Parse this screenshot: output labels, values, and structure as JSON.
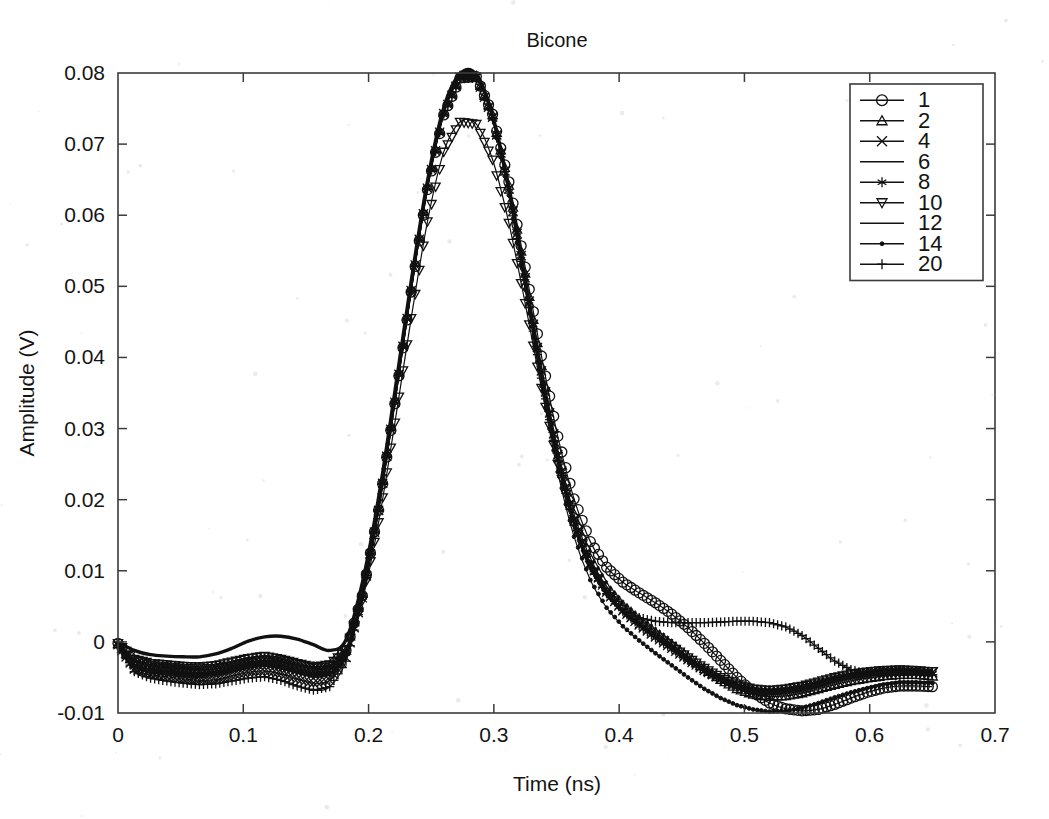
{
  "chart_data": {
    "type": "line",
    "title": "Bicone",
    "xlabel": "Time (ns)",
    "ylabel": "Amplitude (V)",
    "xlim": [
      0,
      0.7
    ],
    "ylim": [
      -0.01,
      0.08
    ],
    "xticks": [
      0,
      0.1,
      0.2,
      0.3,
      0.4,
      0.5,
      0.6,
      0.7
    ],
    "xticklabels": [
      "0",
      "0.1",
      "0.2",
      "0.3",
      "0.4",
      "0.5",
      "0.6",
      "0.7"
    ],
    "yticks": [
      -0.01,
      0,
      0.01,
      0.02,
      0.03,
      0.04,
      0.05,
      0.06,
      0.07,
      0.08
    ],
    "yticklabels": [
      "-0.01",
      "0",
      "0.01",
      "0.02",
      "0.03",
      "0.04",
      "0.05",
      "0.06",
      "0.07",
      "0.08"
    ],
    "grid": false,
    "legend_position": "top-right",
    "legend_entries": [
      "1",
      "2",
      "4",
      "6",
      "8",
      "10",
      "12",
      "14",
      "20"
    ],
    "x": [
      0,
      0.013,
      0.026,
      0.039,
      0.052,
      0.065,
      0.078,
      0.091,
      0.104,
      0.117,
      0.13,
      0.143,
      0.156,
      0.169,
      0.182,
      0.195,
      0.208,
      0.221,
      0.234,
      0.247,
      0.26,
      0.273,
      0.286,
      0.299,
      0.312,
      0.325,
      0.338,
      0.351,
      0.364,
      0.377,
      0.39,
      0.403,
      0.416,
      0.429,
      0.442,
      0.455,
      0.468,
      0.481,
      0.494,
      0.507,
      0.52,
      0.533,
      0.546,
      0.559,
      0.572,
      0.585,
      0.598,
      0.611,
      0.624,
      0.637,
      0.65
    ],
    "series": [
      {
        "name": "1",
        "marker": "circle",
        "linewidth": 1.2,
        "values": [
          -0.0002,
          -0.0028,
          -0.0034,
          -0.0036,
          -0.0038,
          -0.0039,
          -0.0038,
          -0.0034,
          -0.0029,
          -0.0026,
          -0.0028,
          -0.0033,
          -0.0038,
          -0.0036,
          -0.0012,
          0.0065,
          0.0185,
          0.0335,
          0.0492,
          0.0636,
          0.0741,
          0.0793,
          0.0795,
          0.0742,
          0.0647,
          0.0527,
          0.0402,
          0.0289,
          0.0201,
          0.0141,
          0.0105,
          0.0084,
          0.0069,
          0.0055,
          0.0039,
          0.002,
          -0.0002,
          -0.0026,
          -0.005,
          -0.0071,
          -0.0086,
          -0.0094,
          -0.0097,
          -0.0095,
          -0.0088,
          -0.0079,
          -0.0071,
          -0.0065,
          -0.0062,
          -0.0062,
          -0.0063
        ]
      },
      {
        "name": "2",
        "marker": "triangle-up",
        "linewidth": 1.2,
        "values": [
          -0.0003,
          -0.0031,
          -0.0038,
          -0.004,
          -0.0042,
          -0.0043,
          -0.0041,
          -0.0036,
          -0.0031,
          -0.0028,
          -0.0031,
          -0.0036,
          -0.0041,
          -0.0038,
          -0.0012,
          0.0068,
          0.0189,
          0.034,
          0.0497,
          0.0641,
          0.0745,
          0.0796,
          0.0796,
          0.0741,
          0.0642,
          0.0518,
          0.0388,
          0.0271,
          0.018,
          0.0118,
          0.0078,
          0.0052,
          0.0032,
          0.0014,
          -0.0003,
          -0.0021,
          -0.0038,
          -0.0053,
          -0.0066,
          -0.0074,
          -0.0077,
          -0.0076,
          -0.0072,
          -0.0066,
          -0.006,
          -0.0055,
          -0.0051,
          -0.0048,
          -0.0046,
          -0.0046,
          -0.0048
        ]
      },
      {
        "name": "4",
        "marker": "x-cross",
        "linewidth": 1.2,
        "values": [
          -0.0004,
          -0.0038,
          -0.0046,
          -0.0049,
          -0.0052,
          -0.0054,
          -0.0053,
          -0.0048,
          -0.0043,
          -0.0041,
          -0.0045,
          -0.0052,
          -0.0058,
          -0.0054,
          -0.0022,
          0.0062,
          0.0185,
          0.0337,
          0.0494,
          0.0638,
          0.0743,
          0.0794,
          0.0794,
          0.0738,
          0.0637,
          0.0512,
          0.0381,
          0.0263,
          0.0172,
          0.011,
          0.007,
          0.0044,
          0.0024,
          0.0007,
          -0.0009,
          -0.0025,
          -0.004,
          -0.0052,
          -0.0062,
          -0.0068,
          -0.007,
          -0.0068,
          -0.0064,
          -0.0058,
          -0.0052,
          -0.0047,
          -0.0043,
          -0.0041,
          -0.004,
          -0.0041,
          -0.0043
        ]
      },
      {
        "name": "6",
        "marker": "none",
        "linewidth": 1.2,
        "values": [
          -0.0002,
          -0.0026,
          -0.0032,
          -0.0034,
          -0.0036,
          -0.0037,
          -0.0035,
          -0.003,
          -0.0025,
          -0.0022,
          -0.0026,
          -0.0032,
          -0.0037,
          -0.0034,
          -0.0009,
          0.0071,
          0.0192,
          0.0343,
          0.05,
          0.0643,
          0.0747,
          0.0797,
          0.0797,
          0.074,
          0.0639,
          0.0513,
          0.0382,
          0.0264,
          0.0173,
          0.0111,
          0.0071,
          0.0045,
          0.0026,
          0.0009,
          -0.0007,
          -0.0023,
          -0.0038,
          -0.0051,
          -0.0061,
          -0.0067,
          -0.0069,
          -0.0068,
          -0.0064,
          -0.0058,
          -0.0052,
          -0.0047,
          -0.0044,
          -0.0042,
          -0.0041,
          -0.0042,
          -0.0044
        ]
      },
      {
        "name": "8",
        "marker": "asterisk",
        "linewidth": 1.2,
        "values": [
          -0.0003,
          -0.0033,
          -0.004,
          -0.0043,
          -0.0045,
          -0.0046,
          -0.0044,
          -0.0039,
          -0.0034,
          -0.0031,
          -0.0035,
          -0.0041,
          -0.0046,
          -0.0043,
          -0.0016,
          0.0066,
          0.0187,
          0.0338,
          0.0495,
          0.0639,
          0.0744,
          0.0795,
          0.0795,
          0.0739,
          0.0638,
          0.0512,
          0.0381,
          0.0262,
          0.0171,
          0.0109,
          0.0069,
          0.0043,
          0.0023,
          0.0006,
          -0.001,
          -0.0026,
          -0.0041,
          -0.0053,
          -0.0063,
          -0.0069,
          -0.0071,
          -0.0069,
          -0.0065,
          -0.0059,
          -0.0053,
          -0.0048,
          -0.0045,
          -0.0043,
          -0.0042,
          -0.0043,
          -0.0045
        ]
      },
      {
        "name": "10",
        "marker": "triangle-down",
        "linewidth": 1.2,
        "values": [
          -0.0002,
          -0.0024,
          -0.003,
          -0.0032,
          -0.0034,
          -0.0035,
          -0.0033,
          -0.0028,
          -0.0023,
          -0.002,
          -0.0024,
          -0.003,
          -0.0035,
          -0.0032,
          -0.0012,
          0.0058,
          0.0168,
          0.0308,
          0.0455,
          0.0591,
          0.0689,
          0.0731,
          0.0728,
          0.0678,
          0.0589,
          0.0476,
          0.0357,
          0.025,
          0.0166,
          0.0108,
          0.007,
          0.0046,
          0.0027,
          0.001,
          -0.0006,
          -0.0022,
          -0.0037,
          -0.005,
          -0.006,
          -0.0066,
          -0.0068,
          -0.0066,
          -0.0062,
          -0.0056,
          -0.005,
          -0.0045,
          -0.0042,
          -0.004,
          -0.0039,
          -0.004,
          -0.0042
        ]
      },
      {
        "name": "12",
        "marker": "none",
        "linewidth": 3.4,
        "values": [
          0.0,
          -0.0012,
          -0.0018,
          -0.002,
          -0.0021,
          -0.0021,
          -0.0017,
          -0.0009,
          0.0001,
          0.0007,
          0.0008,
          0.0004,
          -0.0004,
          -0.0012,
          0.0003,
          0.0083,
          0.0203,
          0.0352,
          0.0507,
          0.0648,
          0.0751,
          0.0799,
          0.0798,
          0.074,
          0.0636,
          0.0508,
          0.0376,
          0.0258,
          0.0168,
          0.0107,
          0.0068,
          0.0042,
          0.0023,
          0.0006,
          -0.001,
          -0.0026,
          -0.0041,
          -0.0054,
          -0.0064,
          -0.007,
          -0.0072,
          -0.007,
          -0.0066,
          -0.006,
          -0.0054,
          -0.0049,
          -0.0046,
          -0.0044,
          -0.0043,
          -0.0044,
          -0.0046
        ]
      },
      {
        "name": "14",
        "marker": "dot",
        "linewidth": 1.2,
        "values": [
          -0.0004,
          -0.0035,
          -0.0042,
          -0.0045,
          -0.0047,
          -0.0048,
          -0.0046,
          -0.0041,
          -0.0036,
          -0.0033,
          -0.0037,
          -0.0043,
          -0.0049,
          -0.0046,
          -0.0018,
          0.0064,
          0.0186,
          0.0337,
          0.0494,
          0.0638,
          0.0743,
          0.0794,
          0.0793,
          0.0735,
          0.0628,
          0.0496,
          0.036,
          0.0239,
          0.0148,
          0.0087,
          0.0048,
          0.0022,
          0.0002,
          -0.0016,
          -0.0033,
          -0.005,
          -0.0066,
          -0.0079,
          -0.0089,
          -0.0095,
          -0.0098,
          -0.0097,
          -0.0093,
          -0.0086,
          -0.0078,
          -0.0071,
          -0.0065,
          -0.006,
          -0.0057,
          -0.0057,
          -0.0058
        ]
      },
      {
        "name": "20",
        "marker": "plus",
        "linewidth": 1.2,
        "values": [
          -0.0005,
          -0.0042,
          -0.0051,
          -0.0055,
          -0.0058,
          -0.006,
          -0.0059,
          -0.0055,
          -0.0051,
          -0.0049,
          -0.0054,
          -0.0062,
          -0.0068,
          -0.0063,
          -0.0027,
          0.006,
          0.0184,
          0.0336,
          0.0493,
          0.0637,
          0.0742,
          0.0793,
          0.0792,
          0.0734,
          0.0631,
          0.0503,
          0.0371,
          0.0254,
          0.0164,
          0.0104,
          0.0068,
          0.0046,
          0.0034,
          0.0029,
          0.0027,
          0.0027,
          0.0027,
          0.0028,
          0.0029,
          0.0029,
          0.0027,
          0.0021,
          0.0009,
          -0.0009,
          -0.0027,
          -0.0039,
          -0.0045,
          -0.0047,
          -0.0047,
          -0.0046,
          -0.0046
        ]
      }
    ]
  }
}
